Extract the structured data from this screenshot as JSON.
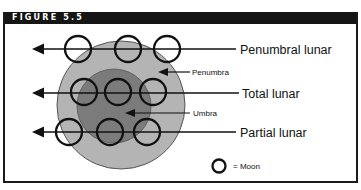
{
  "figure": {
    "title": "FIGURE 5.5"
  },
  "diagram": {
    "colors": {
      "penumbra": "#b4b4b4",
      "umbra": "#7b7b7b",
      "ink": "#111111",
      "header_bg": "#151515",
      "header_text": "#ffffff"
    },
    "regions": {
      "penumbra_label": "Penumbra",
      "umbra_label": "Umbra"
    },
    "paths": [
      {
        "label": "Penumbral lunar",
        "moons": 3
      },
      {
        "label": "Total lunar",
        "moons": 3
      },
      {
        "label": "Partial lunar",
        "moons": 3
      }
    ],
    "legend": {
      "symbol": "moon-circle",
      "text": "= Moon"
    }
  }
}
